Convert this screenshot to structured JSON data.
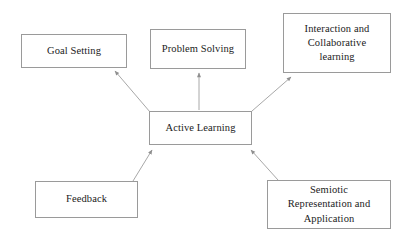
{
  "diagram": {
    "type": "concept-map",
    "canvas": {
      "width": 405,
      "height": 236,
      "background": "#ffffff"
    },
    "style": {
      "box_border_color": "#9a9a9a",
      "box_fill_color": "#ffffff",
      "connector_color": "#a8a8a8",
      "text_color": "#1b1b1b"
    },
    "center_node": {
      "id": "active-learning",
      "label": "Active Learning"
    },
    "nodes": [
      {
        "id": "goal-setting",
        "label": "Goal Setting"
      },
      {
        "id": "problem-solving",
        "label": "Problem Solving"
      },
      {
        "id": "interaction",
        "label": "Interaction and\nCollaborative\nlearning"
      },
      {
        "id": "feedback",
        "label": "Feedback"
      },
      {
        "id": "semiotic",
        "label": "Semiotic\nRepresentation and\nApplication"
      }
    ],
    "connectors": [
      {
        "id": "conn-active-to-goal",
        "from": "active-learning",
        "to": "goal-setting",
        "arrowhead": "at-target"
      },
      {
        "id": "conn-active-to-problem",
        "from": "active-learning",
        "to": "problem-solving",
        "arrowhead": "at-target"
      },
      {
        "id": "conn-active-to-interaction",
        "from": "active-learning",
        "to": "interaction",
        "arrowhead": "at-target"
      },
      {
        "id": "conn-feedback-to-active",
        "from": "feedback",
        "to": "active-learning",
        "arrowhead": "at-target"
      },
      {
        "id": "conn-semiotic-to-active",
        "from": "semiotic",
        "to": "active-learning",
        "arrowhead": "at-target"
      }
    ]
  }
}
